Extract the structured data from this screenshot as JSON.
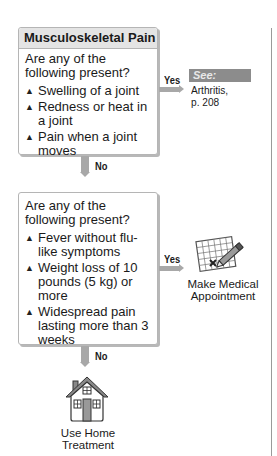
{
  "flowchart": {
    "title": "Musculoskeletal Pain",
    "step1": {
      "question": "Are any of the following present?",
      "items": [
        "Swelling of a joint",
        "Redness or heat in a joint",
        "Pain when a joint moves"
      ],
      "yes_label": "Yes",
      "no_label": "No",
      "yes_outcome": {
        "tag": "See:",
        "text_line1": "Arthritis,",
        "text_line2": "p. 208"
      }
    },
    "step2": {
      "question": "Are any of the following present?",
      "items": [
        "Fever without flu-like symptoms",
        "Weight loss of 10 pounds (5 kg) or more",
        "Widespread pain lasting more than 3 weeks"
      ],
      "yes_label": "Yes",
      "no_label": "No",
      "yes_outcome": {
        "icon": "calendar-pencil-icon",
        "line1": "Make Medical",
        "line2": "Appointment"
      },
      "no_outcome": {
        "icon": "house-icon",
        "line1": "Use Home",
        "line2": "Treatment"
      }
    },
    "bullet_glyph": "▲",
    "colors": {
      "arrow": "#a8a8a8",
      "see_tag_bg": "#8c8c8c",
      "title_bg": "#e4e4e4",
      "box_border": "#b5b5b5"
    }
  }
}
